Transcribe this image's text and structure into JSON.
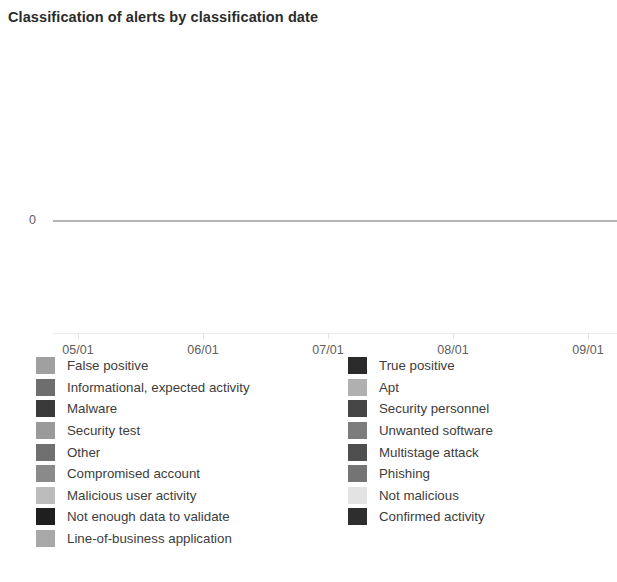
{
  "chart_data": {
    "type": "line",
    "title": "Classification of alerts by classification date",
    "xlabel": "",
    "ylabel": "",
    "grid": false,
    "legend_position": "bottom",
    "x_tick_labels": [
      "05/01",
      "06/01",
      "07/01",
      "08/01",
      "09/01"
    ],
    "y_tick_labels": [
      "0"
    ],
    "ylim": [
      0,
      0
    ],
    "series": [
      {
        "name": "False positive",
        "color": "#a0a0a0",
        "values": [
          0,
          0,
          0,
          0,
          0
        ]
      },
      {
        "name": "Informational, expected activity",
        "color": "#6e6e6e",
        "values": [
          0,
          0,
          0,
          0,
          0
        ]
      },
      {
        "name": "Malware",
        "color": "#3a3a3a",
        "values": [
          0,
          0,
          0,
          0,
          0
        ]
      },
      {
        "name": "Security test",
        "color": "#9a9a9a",
        "values": [
          0,
          0,
          0,
          0,
          0
        ]
      },
      {
        "name": "Other",
        "color": "#707070",
        "values": [
          0,
          0,
          0,
          0,
          0
        ]
      },
      {
        "name": "Compromised account",
        "color": "#8a8a8a",
        "values": [
          0,
          0,
          0,
          0,
          0
        ]
      },
      {
        "name": "Malicious user activity",
        "color": "#bcbcbc",
        "values": [
          0,
          0,
          0,
          0,
          0
        ]
      },
      {
        "name": "Not enough data to validate",
        "color": "#1f1f1f",
        "values": [
          0,
          0,
          0,
          0,
          0
        ]
      },
      {
        "name": "Line-of-business application",
        "color": "#a8a8a8",
        "values": [
          0,
          0,
          0,
          0,
          0
        ]
      },
      {
        "name": "True positive",
        "color": "#2a2a2a",
        "values": [
          0,
          0,
          0,
          0,
          0
        ]
      },
      {
        "name": "Apt",
        "color": "#b0b0b0",
        "values": [
          0,
          0,
          0,
          0,
          0
        ]
      },
      {
        "name": "Security personnel",
        "color": "#454545",
        "values": [
          0,
          0,
          0,
          0,
          0
        ]
      },
      {
        "name": "Unwanted software",
        "color": "#7c7c7c",
        "values": [
          0,
          0,
          0,
          0,
          0
        ]
      },
      {
        "name": "Multistage attack",
        "color": "#4e4e4e",
        "values": [
          0,
          0,
          0,
          0,
          0
        ]
      },
      {
        "name": "Phishing",
        "color": "#747474",
        "values": [
          0,
          0,
          0,
          0,
          0
        ]
      },
      {
        "name": "Not malicious",
        "color": "#e3e3e3",
        "values": [
          0,
          0,
          0,
          0,
          0
        ]
      },
      {
        "name": "Confirmed activity",
        "color": "#2e2e2e",
        "values": [
          0,
          0,
          0,
          0,
          0
        ]
      }
    ]
  },
  "header": {
    "title": "Classification of alerts by classification date"
  },
  "axes": {
    "y": {
      "ticks": [
        {
          "label": "0",
          "top_px": 170
        }
      ]
    },
    "x": {
      "ticks": [
        {
          "label": "05/01",
          "x_px": 78
        },
        {
          "label": "06/01",
          "x_px": 203
        },
        {
          "label": "07/01",
          "x_px": 328
        },
        {
          "label": "08/01",
          "x_px": 453
        },
        {
          "label": "09/01",
          "x_px": 588
        }
      ]
    }
  },
  "legend": {
    "columns": [
      {
        "name": "legend-column-left",
        "items": [
          {
            "label": "False positive",
            "color": "#a0a0a0"
          },
          {
            "label": "Informational, expected activity",
            "color": "#6e6e6e"
          },
          {
            "label": "Malware",
            "color": "#3a3a3a"
          },
          {
            "label": "Security test",
            "color": "#9a9a9a"
          },
          {
            "label": "Other",
            "color": "#707070"
          },
          {
            "label": "Compromised account",
            "color": "#8a8a8a"
          },
          {
            "label": "Malicious user activity",
            "color": "#bcbcbc"
          },
          {
            "label": "Not enough data to validate",
            "color": "#1f1f1f"
          },
          {
            "label": "Line-of-business application",
            "color": "#a8a8a8"
          }
        ]
      },
      {
        "name": "legend-column-right",
        "items": [
          {
            "label": "True positive",
            "color": "#2a2a2a"
          },
          {
            "label": "Apt",
            "color": "#b0b0b0"
          },
          {
            "label": "Security personnel",
            "color": "#454545"
          },
          {
            "label": "Unwanted software",
            "color": "#7c7c7c"
          },
          {
            "label": "Multistage attack",
            "color": "#4e4e4e"
          },
          {
            "label": "Phishing",
            "color": "#747474"
          },
          {
            "label": "Not malicious",
            "color": "#e3e3e3"
          },
          {
            "label": "Confirmed activity",
            "color": "#2e2e2e"
          }
        ]
      }
    ]
  },
  "series_line": {
    "color": "#9b9b9b"
  }
}
